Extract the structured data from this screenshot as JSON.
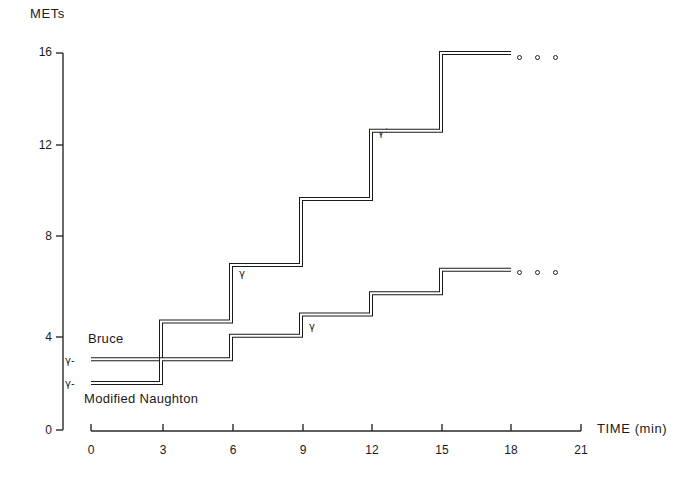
{
  "chart_data": {
    "type": "line",
    "title": "METs",
    "xlabel": "TIME  (min)",
    "ylabel": "METs",
    "xlim": [
      0,
      21
    ],
    "ylim": [
      0,
      16
    ],
    "grid": false,
    "legend": "inline-labels",
    "x_ticks": [
      "0",
      "3",
      "6",
      "9",
      "12",
      "15",
      "18",
      "21"
    ],
    "x_tick_values": [
      0,
      3,
      6,
      9,
      12,
      15,
      18,
      21
    ],
    "y_ticks": [
      "0",
      "4",
      "8",
      "12",
      "16"
    ],
    "y_tick_values": [
      0,
      4,
      8,
      12,
      16
    ],
    "series": [
      {
        "name": "Bruce",
        "step_starts": [
          0,
          3,
          6,
          9,
          12,
          15
        ],
        "step_ends": [
          3,
          6,
          9,
          12,
          15,
          18
        ],
        "values": [
          3.0,
          4.6,
          7.0,
          9.8,
          12.7,
          16.0
        ],
        "continues": true,
        "continuation_marker": "three-open-circles"
      },
      {
        "name": "Modified Naughton",
        "step_starts": [
          0,
          3,
          6,
          9,
          12,
          15
        ],
        "step_ends": [
          3,
          6,
          9,
          12,
          15,
          18
        ],
        "values": [
          2.0,
          3.0,
          4.0,
          4.9,
          5.8,
          6.8
        ],
        "continues": true,
        "continuation_marker": "three-open-circles"
      }
    ],
    "annotations": [
      {
        "text": "γ-",
        "x": 0,
        "y": 3.0,
        "note": "start marker on Bruce baseline"
      },
      {
        "text": "γ-",
        "x": 0,
        "y": 2.0,
        "note": "start marker on Modified Naughton baseline"
      },
      {
        "text": "γ",
        "x": 6,
        "y": 7.0,
        "note": "marker on Bruce 6-9 min step"
      },
      {
        "text": "γ*",
        "x": 12,
        "y": 12.7,
        "note": "marker on Bruce 12-15 min step"
      },
      {
        "text": "γ",
        "x": 9,
        "y": 4.0,
        "note": "marker on Modified Naughton 9-12 min step"
      }
    ]
  },
  "labels": {
    "mets_title": "METs",
    "time_title": "TIME  (min)",
    "bruce": "Bruce",
    "naughton": "Modified  Naughton"
  },
  "y_tick_text": [
    "16",
    "12",
    "8",
    "4",
    "0"
  ],
  "x_tick_text": [
    "0",
    "3",
    "6",
    "9",
    "12",
    "15",
    "18",
    "21"
  ],
  "gamma_marks": {
    "bruce_start": "γ-",
    "naughton_start": "γ-",
    "bruce_six": "γ",
    "bruce_twelve": "γ*",
    "naughton_nine": "γ"
  },
  "colors": {
    "line": "#1a1a1a",
    "axis": "#2a2a2a",
    "background": "#ffffff"
  }
}
